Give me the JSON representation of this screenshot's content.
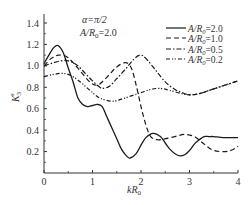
{
  "chart_data": {
    "type": "line",
    "title": "",
    "xlabel": "kR0",
    "ylabel": "K3s",
    "xlim": [
      0,
      4
    ],
    "ylim": [
      0,
      1.5
    ],
    "xticks": [
      0,
      1,
      2,
      3,
      4
    ],
    "yticks": [
      0.2,
      0.4,
      0.6,
      0.8,
      1.0,
      1.2,
      1.4
    ],
    "xtick_labels": [
      "0",
      "1",
      "2",
      "3",
      "4"
    ],
    "ytick_labels": [
      "0.2",
      "0.4",
      "0.6",
      "0.8",
      "1.0",
      "1.2",
      "1.4"
    ],
    "grid": false,
    "legend_position": "upper right",
    "annotations": [
      "α=π/2",
      "A/R0=2.0"
    ],
    "series": [
      {
        "name": "A/R0=2.0",
        "style": "solid",
        "x": [
          0,
          0.1,
          0.2,
          0.29,
          0.4,
          0.5,
          0.6,
          0.7,
          0.8,
          0.9,
          1.0,
          1.1,
          1.2,
          1.3,
          1.4,
          1.5,
          1.6,
          1.7,
          1.78,
          1.9,
          2.0,
          2.1,
          2.25,
          2.4,
          2.5,
          2.6,
          2.7,
          2.8,
          2.9,
          3.0,
          3.1,
          3.2,
          3.3,
          3.4,
          3.5,
          3.7,
          4.0
        ],
        "y": [
          1.02,
          1.1,
          1.17,
          1.19,
          1.12,
          0.98,
          0.85,
          0.7,
          0.64,
          0.62,
          0.63,
          0.64,
          0.62,
          0.52,
          0.42,
          0.32,
          0.22,
          0.16,
          0.14,
          0.18,
          0.26,
          0.33,
          0.37,
          0.34,
          0.28,
          0.22,
          0.18,
          0.16,
          0.17,
          0.21,
          0.27,
          0.31,
          0.34,
          0.34,
          0.34,
          0.33,
          0.33
        ]
      },
      {
        "name": "A/R0=1.0",
        "style": "dashed",
        "x": [
          0,
          0.15,
          0.3,
          0.45,
          0.6,
          0.75,
          0.9,
          1.0,
          1.1,
          1.2,
          1.35,
          1.5,
          1.68,
          1.8,
          1.9,
          2.0,
          2.1,
          2.2,
          2.35,
          2.5,
          2.7,
          2.9,
          3.1,
          3.3,
          3.5,
          3.75,
          3.9,
          4.0
        ],
        "y": [
          1.0,
          1.07,
          1.1,
          1.09,
          1.03,
          0.95,
          0.87,
          0.83,
          0.82,
          0.85,
          0.92,
          0.99,
          1.03,
          0.98,
          0.82,
          0.62,
          0.45,
          0.34,
          0.31,
          0.32,
          0.34,
          0.36,
          0.34,
          0.27,
          0.21,
          0.2,
          0.22,
          0.25
        ]
      },
      {
        "name": "A/R0=0.5",
        "style": "dash-dot",
        "x": [
          0,
          0.2,
          0.4,
          0.55,
          0.7,
          0.85,
          1.0,
          1.15,
          1.22,
          1.35,
          1.5,
          1.7,
          1.85,
          1.98,
          2.1,
          2.3,
          2.5,
          2.7,
          2.85,
          3.0,
          3.2,
          3.4,
          3.6,
          3.8,
          4.0
        ],
        "y": [
          1.0,
          1.03,
          1.05,
          1.04,
          1.0,
          0.93,
          0.86,
          0.8,
          0.79,
          0.81,
          0.88,
          0.98,
          1.06,
          1.1,
          1.07,
          0.96,
          0.85,
          0.78,
          0.75,
          0.73,
          0.74,
          0.77,
          0.8,
          0.83,
          0.86
        ]
      },
      {
        "name": "A/R0=0.2",
        "style": "dash-dot-dot",
        "x": [
          0,
          0.2,
          0.38,
          0.55,
          0.75,
          0.95,
          1.15,
          1.4,
          1.6,
          1.8,
          2.0,
          2.2,
          2.4,
          2.6,
          2.85,
          3.0,
          3.2,
          3.4,
          3.6,
          3.8,
          4.0
        ],
        "y": [
          0.9,
          0.92,
          0.93,
          0.91,
          0.85,
          0.77,
          0.7,
          0.67,
          0.69,
          0.72,
          0.75,
          0.78,
          0.79,
          0.77,
          0.74,
          0.73,
          0.74,
          0.77,
          0.8,
          0.83,
          0.86
        ]
      }
    ]
  },
  "axes": {
    "xlabel_main": "kR",
    "xlabel_sub": "0",
    "ylabel_main": "K",
    "ylabel_sub": "3",
    "ylabel_sup": "s"
  },
  "annotation": {
    "line1": "α=π/2",
    "line2_main": "A/R",
    "line2_sub": "0",
    "line2_val": "=2.0"
  },
  "legend": [
    {
      "main": "A/R",
      "sub": "0",
      "val": "=2.0",
      "dash": ""
    },
    {
      "main": "A/R",
      "sub": "0",
      "val": "=1.0",
      "dash": "5,3"
    },
    {
      "main": "A/R",
      "sub": "0",
      "val": "=0.5",
      "dash": "5,2,1.5,2"
    },
    {
      "main": "A/R",
      "sub": "0",
      "val": "=0.2",
      "dash": "4,2,1.2,1.5,1.2,2"
    }
  ],
  "colors": {
    "line": "#1a1a1a",
    "axis": "#333333",
    "text": "#333333"
  }
}
